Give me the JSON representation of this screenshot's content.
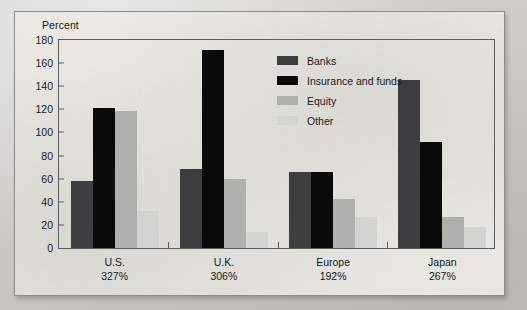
{
  "figure": {
    "axis_title": "Percent"
  },
  "chart_data": {
    "type": "bar",
    "title": "",
    "xlabel": "",
    "ylabel": "Percent",
    "ylim": [
      0,
      180
    ],
    "yticks": [
      0,
      20,
      40,
      60,
      80,
      100,
      120,
      140,
      160,
      180
    ],
    "ytick_labels": [
      "0",
      "20",
      "40",
      "60",
      "80",
      "100",
      "120",
      "140",
      "160",
      "180"
    ],
    "grid": false,
    "legend_position": "inside top-right",
    "categories": [
      "U.S.",
      "U.K.",
      "Europe",
      "Japan"
    ],
    "category_sublabels": [
      "327%",
      "306%",
      "192%",
      "267%"
    ],
    "series": [
      {
        "name": "Banks",
        "color": "#3d3d40",
        "values": [
          58,
          68,
          66,
          145
        ]
      },
      {
        "name": "Insurance and funds",
        "color": "#090909",
        "values": [
          121,
          171,
          66,
          92
        ]
      },
      {
        "name": "Equity",
        "color": "#b0b0ad",
        "values": [
          119,
          60,
          42,
          27
        ]
      },
      {
        "name": "Other",
        "color": "#d4d4d1",
        "values": [
          32,
          14,
          27,
          18
        ]
      }
    ]
  }
}
